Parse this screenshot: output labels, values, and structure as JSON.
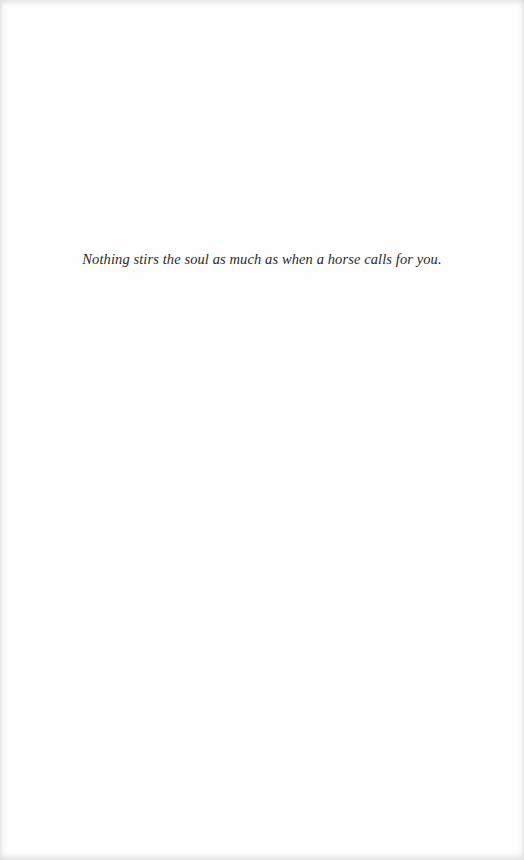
{
  "page": {
    "epigraph": "Nothing stirs the soul as much as when a horse calls for you."
  }
}
